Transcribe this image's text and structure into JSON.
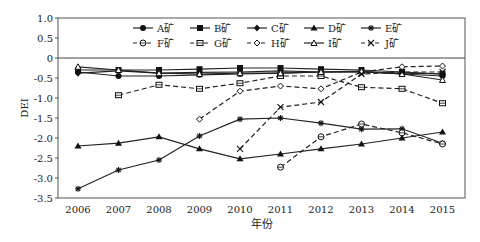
{
  "chart_data": {
    "type": "line",
    "title": "",
    "xlabel": "年份",
    "ylabel": "DEI",
    "ylim": [
      -3.5,
      1.0
    ],
    "yticks": [
      "1.0",
      "0.5",
      "0",
      "-0.5",
      "-1.0",
      "-1.5",
      "-2.0",
      "-2.5",
      "-3.0",
      "-3.5"
    ],
    "x": [
      2006,
      2007,
      2008,
      2009,
      2010,
      2011,
      2012,
      2013,
      2014,
      2015
    ],
    "legend_position": "top-inside",
    "series": [
      {
        "name": "A矿",
        "marker": "filled-circle",
        "dash": "solid",
        "values": [
          -0.35,
          -0.45,
          -0.45,
          -0.42,
          -0.4,
          -0.38,
          -0.35,
          -0.35,
          -0.4,
          -0.45
        ]
      },
      {
        "name": "B矿",
        "marker": "filled-square",
        "dash": "solid",
        "values": [
          -0.3,
          -0.3,
          -0.3,
          -0.28,
          -0.25,
          -0.25,
          -0.28,
          -0.3,
          -0.35,
          -0.4
        ]
      },
      {
        "name": "C矿",
        "marker": "filled-diamond",
        "dash": "solid",
        "values": [
          -0.38,
          -0.32,
          -0.38,
          -0.36,
          -0.35,
          -0.32,
          -0.35,
          -0.35,
          -0.38,
          -0.4
        ]
      },
      {
        "name": "D矿",
        "marker": "filled-triangle",
        "dash": "solid",
        "values": [
          -2.2,
          -2.13,
          -1.97,
          -2.27,
          -2.52,
          -2.4,
          -2.27,
          -2.15,
          -2.0,
          -1.85
        ]
      },
      {
        "name": "E矿",
        "marker": "star",
        "dash": "solid",
        "values": [
          -3.27,
          -2.8,
          -2.55,
          -1.95,
          -1.53,
          -1.5,
          -1.63,
          -1.78,
          -1.77,
          -2.13
        ]
      },
      {
        "name": "F矿",
        "marker": "open-circle",
        "dash": "dashed",
        "values": [
          null,
          null,
          null,
          null,
          null,
          -2.73,
          -1.97,
          -1.65,
          -1.87,
          -2.15
        ]
      },
      {
        "name": "G矿",
        "marker": "open-square",
        "dash": "dashed",
        "values": [
          null,
          -0.93,
          -0.67,
          -0.77,
          -0.63,
          -0.45,
          -0.45,
          -0.73,
          -0.77,
          -1.13
        ]
      },
      {
        "name": "H矿",
        "marker": "open-diamond",
        "dash": "dashed",
        "values": [
          null,
          null,
          null,
          -1.53,
          -0.83,
          -0.7,
          -0.77,
          -0.35,
          -0.22,
          -0.2
        ]
      },
      {
        "name": "I矿",
        "marker": "open-triangle",
        "dash": "solid",
        "values": [
          -0.22,
          -0.3,
          -0.38,
          -0.4,
          -0.38,
          -0.38,
          -0.35,
          -0.33,
          -0.4,
          -0.55
        ]
      },
      {
        "name": "J矿",
        "marker": "x",
        "dash": "dashed",
        "values": [
          null,
          null,
          null,
          null,
          -2.27,
          -1.23,
          -1.1,
          -0.4,
          -0.35,
          -0.35
        ]
      }
    ],
    "zero_line": true
  }
}
